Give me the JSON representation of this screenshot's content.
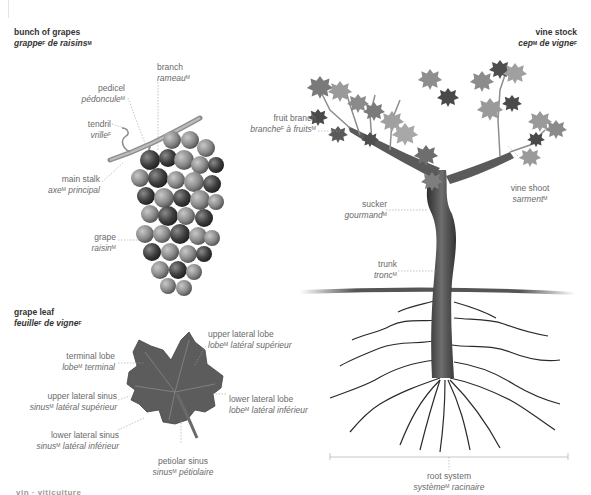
{
  "sections": {
    "grapes": {
      "title_en": "bunch of grapes",
      "title_fr_word": "grappe",
      "title_fr_gender": "F",
      "title_fr_rest": " de raisins",
      "title_fr_rest_gender": "M"
    },
    "leaf": {
      "title_en": "grape leaf",
      "title_fr_word": "feuille",
      "title_fr_gender": "F",
      "title_fr_rest": " de vigne",
      "title_fr_rest_gender": "F"
    },
    "vine": {
      "title_en": "vine stock",
      "title_fr_word": "cep",
      "title_fr_gender": "M",
      "title_fr_rest": " de vigne",
      "title_fr_rest_gender": "F"
    }
  },
  "labels": {
    "branch": {
      "en": "branch",
      "fr": "rameau",
      "g": "M"
    },
    "pedicel": {
      "en": "pedicel",
      "fr": "pédoncule",
      "g": "M"
    },
    "tendril": {
      "en": "tendril",
      "fr": "vrille",
      "g": "F"
    },
    "main_stalk": {
      "en": "main stalk",
      "fr": "axe",
      "g": "M",
      "fr_rest": " principal"
    },
    "grape": {
      "en": "grape",
      "fr": "raisin",
      "g": "M"
    },
    "terminal_lobe": {
      "en": "terminal lobe",
      "fr": "lobe",
      "g": "M",
      "fr_rest": " terminal"
    },
    "upper_lateral_lobe": {
      "en": "upper lateral lobe",
      "fr": "lobe",
      "g": "M",
      "fr_rest": " latéral supérieur"
    },
    "lower_lateral_lobe": {
      "en": "lower lateral lobe",
      "fr": "lobe",
      "g": "M",
      "fr_rest": " latéral inférieur"
    },
    "upper_lateral_sinus": {
      "en": "upper lateral sinus",
      "fr": "sinus",
      "g": "M",
      "fr_rest": " latéral supérieur"
    },
    "lower_lateral_sinus": {
      "en": "lower lateral sinus",
      "fr": "sinus",
      "g": "M",
      "fr_rest": " latéral inférieur"
    },
    "petiolar_sinus": {
      "en": "petiolar sinus",
      "fr": "sinus",
      "g": "M",
      "fr_rest": " pétiolaire"
    },
    "fruit_branch": {
      "en": "fruit branch",
      "fr": "branche",
      "g": "F",
      "fr_rest": " à fruits",
      "g2": "M"
    },
    "vine_shoot": {
      "en": "vine shoot",
      "fr": "sarment",
      "g": "M"
    },
    "sucker": {
      "en": "sucker",
      "fr": "gourmand",
      "g": "M"
    },
    "trunk": {
      "en": "trunk",
      "fr": "tronc",
      "g": "M"
    },
    "root_system": {
      "en": "root system",
      "fr": "système",
      "g": "M",
      "fr_rest": " racinaire"
    }
  },
  "footer": {
    "cut_text": "vin · viticulture"
  },
  "colors": {
    "grape_dark": "#3a3a3a",
    "grape_light": "#9a9a9a",
    "leaf": "#5a5a5a",
    "trunk": "#4a4a4a",
    "ground": "#3c3c3c",
    "leader": "#9c9c9c"
  }
}
